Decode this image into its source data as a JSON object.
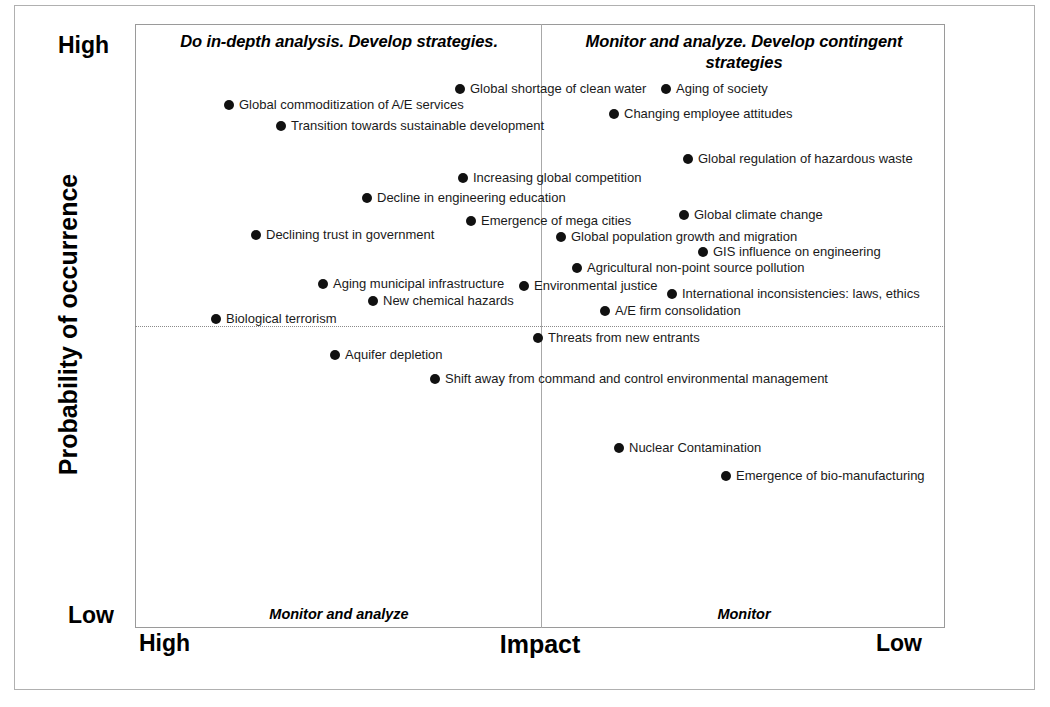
{
  "chart_data": {
    "type": "scatter",
    "title": "",
    "xlabel": "Impact",
    "ylabel": "Probability of occurrence",
    "x_axis": {
      "left_label": "High",
      "right_label": "Low",
      "inverted": true
    },
    "y_axis": {
      "top_label": "High",
      "bottom_label": "Low"
    },
    "grid": false,
    "legend": "none",
    "quadrants": {
      "top_left": "Do in-depth analysis.  Develop strategies.",
      "top_right": "Monitor and analyze.  Develop contingent strategies",
      "bottom_left": "Monitor and analyze",
      "bottom_right": "Monitor"
    },
    "points": [
      {
        "label": "Global shortage of clean water",
        "x": 460,
        "y": 88,
        "quadrant": "top_left"
      },
      {
        "label": "Aging of society",
        "x": 666,
        "y": 88,
        "quadrant": "top_right"
      },
      {
        "label": "Global commoditization of A/E services",
        "x": 229,
        "y": 104,
        "quadrant": "top_left"
      },
      {
        "label": "Changing employee attitudes",
        "x": 614,
        "y": 113,
        "quadrant": "top_right"
      },
      {
        "label": "Transition towards sustainable development",
        "x": 281,
        "y": 125,
        "quadrant": "top_left"
      },
      {
        "label": "Global regulation of hazardous waste",
        "x": 688,
        "y": 158,
        "quadrant": "top_right"
      },
      {
        "label": "Increasing global competition",
        "x": 463,
        "y": 177,
        "quadrant": "top_left"
      },
      {
        "label": "Decline in engineering education",
        "x": 367,
        "y": 197,
        "quadrant": "top_left"
      },
      {
        "label": "Emergence of mega cities",
        "x": 471,
        "y": 220,
        "quadrant": "top_left"
      },
      {
        "label": "Global climate change",
        "x": 684,
        "y": 214,
        "quadrant": "top_right"
      },
      {
        "label": "Declining trust in government",
        "x": 256,
        "y": 234,
        "quadrant": "top_left"
      },
      {
        "label": "Global population growth and migration",
        "x": 561,
        "y": 236,
        "quadrant": "top_right"
      },
      {
        "label": "GIS influence on engineering",
        "x": 703,
        "y": 251,
        "quadrant": "top_right"
      },
      {
        "label": "Agricultural non-point source pollution",
        "x": 577,
        "y": 267,
        "quadrant": "top_right"
      },
      {
        "label": "Aging municipal infrastructure",
        "x": 323,
        "y": 283,
        "quadrant": "top_left"
      },
      {
        "label": "Environmental justice",
        "x": 524,
        "y": 285,
        "quadrant": "top_left"
      },
      {
        "label": "International inconsistencies:  laws, ethics",
        "x": 672,
        "y": 293,
        "quadrant": "top_right"
      },
      {
        "label": "New chemical hazards",
        "x": 373,
        "y": 300,
        "quadrant": "top_left"
      },
      {
        "label": "A/E firm consolidation",
        "x": 605,
        "y": 310,
        "quadrant": "top_right"
      },
      {
        "label": "Biological terrorism",
        "x": 216,
        "y": 318,
        "quadrant": "top_left"
      },
      {
        "label": "Threats from new entrants",
        "x": 538,
        "y": 337,
        "quadrant": "bottom_right"
      },
      {
        "label": "Aquifer depletion",
        "x": 335,
        "y": 354,
        "quadrant": "bottom_left"
      },
      {
        "label": "Shift away from command and control environmental management",
        "x": 435,
        "y": 378,
        "quadrant": "bottom_left"
      },
      {
        "label": "Nuclear Contamination",
        "x": 619,
        "y": 447,
        "quadrant": "bottom_right"
      },
      {
        "label": "Emergence of bio-manufacturing",
        "x": 726,
        "y": 475,
        "quadrant": "bottom_right"
      }
    ],
    "colors": {
      "marker": "#111111",
      "frame": "#9a9a9a",
      "text": "#000000"
    }
  }
}
